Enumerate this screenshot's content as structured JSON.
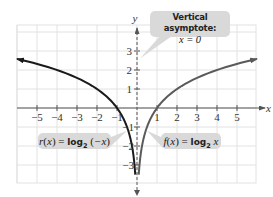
{
  "chart_data": {
    "type": "line",
    "title": "",
    "xlabel": "x",
    "ylabel": "y",
    "xlim": [
      -6,
      6
    ],
    "ylim": [
      -4,
      4
    ],
    "grid": true,
    "x_ticks": [
      "-5",
      "-4",
      "-3",
      "-2",
      "-1",
      "1",
      "2",
      "3",
      "4",
      "5"
    ],
    "y_ticks": [
      "3",
      "2",
      "1",
      "-1",
      "-2",
      "-3"
    ],
    "series": [
      {
        "name": "r(x) = log2(-x)",
        "color": "#1a1a1a",
        "domain": "x < 0",
        "points": [
          [
            -6,
            2.585
          ],
          [
            -5,
            2.322
          ],
          [
            -4,
            2.0
          ],
          [
            -3,
            1.585
          ],
          [
            -2,
            1.0
          ],
          [
            -1,
            0.0
          ],
          [
            -0.5,
            -1.0
          ],
          [
            -0.25,
            -2.0
          ],
          [
            -0.125,
            -3.0
          ],
          [
            -0.09,
            -3.47
          ]
        ]
      },
      {
        "name": "f(x) = log2 x",
        "color": "#5a5a5a",
        "domain": "x > 0",
        "points": [
          [
            0.09,
            -3.47
          ],
          [
            0.125,
            -3.0
          ],
          [
            0.25,
            -2.0
          ],
          [
            0.5,
            -1.0
          ],
          [
            1,
            0.0
          ],
          [
            2,
            1.0
          ],
          [
            3,
            1.585
          ],
          [
            4,
            2.0
          ],
          [
            5,
            2.322
          ],
          [
            6,
            2.585
          ]
        ]
      }
    ],
    "annotations": [
      {
        "text": "Vertical asymptote: x = 0",
        "target": "y-axis (x = 0)"
      },
      {
        "text": "r(x) = log2(-x)",
        "target": "left curve"
      },
      {
        "text": "f(x) = log2 x",
        "target": "right curve"
      }
    ]
  },
  "labels": {
    "x_axis": "x",
    "y_axis": "y",
    "x_ticks": [
      "−5",
      "−4",
      "−3",
      "−2",
      "−1",
      "1",
      "2",
      "3",
      "4",
      "5"
    ],
    "y_pos_ticks": [
      "3",
      "2",
      "1"
    ],
    "y_neg_ticks": [
      "−1",
      "−2",
      "−3"
    ]
  },
  "callouts": {
    "asymptote": {
      "title": "Vertical asymptote:",
      "equation": "x = 0"
    },
    "r": {
      "name": "r",
      "var": "x",
      "log": "log",
      "base": "2",
      "arg": "−x"
    },
    "f": {
      "name": "f",
      "var": "x",
      "log": "log",
      "base": "2",
      "arg": "x"
    }
  },
  "colors": {
    "grid": "#e2e2e2",
    "axis": "#555555",
    "r_curve": "#1a1a1a",
    "f_curve": "#5a5a5a",
    "callout_bg": "#d9d9d9"
  }
}
